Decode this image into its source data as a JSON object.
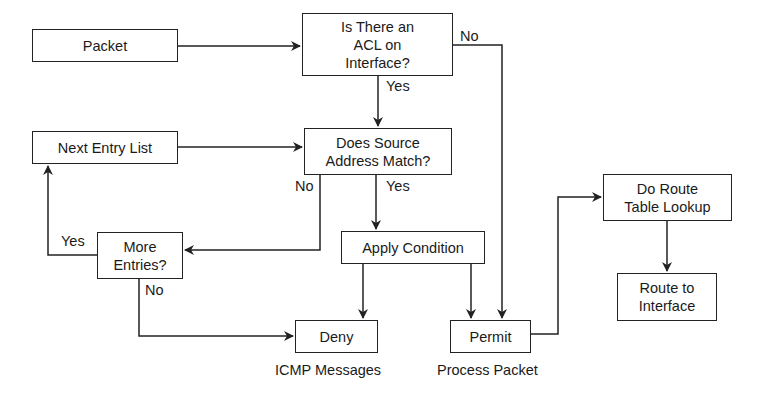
{
  "diagram": {
    "nodes": {
      "packet": "Packet",
      "acl_check": "Is There an\nACL on\nInterface?",
      "source_match": "Does Source\nAddress Match?",
      "next_entry": "Next Entry List",
      "more_entries": "More\nEntries?",
      "apply_condition": "Apply Condition",
      "deny": "Deny",
      "permit": "Permit",
      "route_lookup": "Do Route\nTable Lookup",
      "route_interface": "Route to\nInterface"
    },
    "edge_labels": {
      "acl_no": "No",
      "acl_yes": "Yes",
      "source_no": "No",
      "source_yes": "Yes",
      "more_yes": "Yes",
      "more_no": "No"
    },
    "captions": {
      "deny_caption": "ICMP Messages",
      "permit_caption": "Process Packet"
    },
    "colors": {
      "line": "#222222",
      "background": "#ffffff"
    }
  }
}
